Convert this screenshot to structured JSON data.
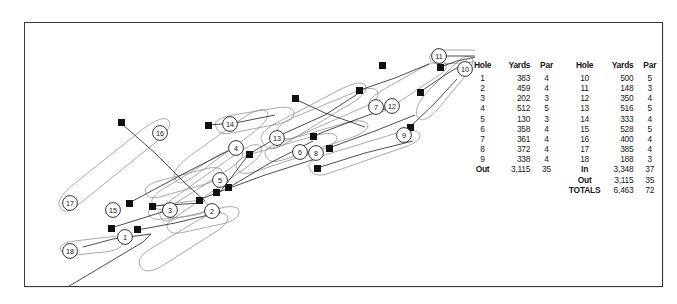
{
  "figure": {
    "kind": "golf-course-routing-plan-with-scorecard",
    "frame_color": "#3a3a3a",
    "ink_color": "#1a1a1a",
    "fairway_color": "#8c8c8c"
  },
  "scorecard": {
    "headers": [
      "Hole",
      "Yards",
      "Par",
      "Hole",
      "Yards",
      "Par"
    ],
    "front_nine": [
      {
        "hole": "1",
        "yards": "383",
        "par": "4"
      },
      {
        "hole": "2",
        "yards": "459",
        "par": "4"
      },
      {
        "hole": "3",
        "yards": "202",
        "par": "3"
      },
      {
        "hole": "4",
        "yards": "512",
        "par": "5"
      },
      {
        "hole": "5",
        "yards": "130",
        "par": "3"
      },
      {
        "hole": "6",
        "yards": "358",
        "par": "4"
      },
      {
        "hole": "7",
        "yards": "361",
        "par": "4"
      },
      {
        "hole": "8",
        "yards": "372",
        "par": "4"
      },
      {
        "hole": "9",
        "yards": "338",
        "par": "4"
      }
    ],
    "back_nine": [
      {
        "hole": "10",
        "yards": "500",
        "par": "5"
      },
      {
        "hole": "11",
        "yards": "148",
        "par": "3"
      },
      {
        "hole": "12",
        "yards": "350",
        "par": "4"
      },
      {
        "hole": "13",
        "yards": "516",
        "par": "5"
      },
      {
        "hole": "14",
        "yards": "333",
        "par": "4"
      },
      {
        "hole": "15",
        "yards": "528",
        "par": "5"
      },
      {
        "hole": "16",
        "yards": "400",
        "par": "4"
      },
      {
        "hole": "17",
        "yards": "385",
        "par": "4"
      },
      {
        "hole": "18",
        "yards": "188",
        "par": "3"
      }
    ],
    "totals": {
      "out_label": "Out",
      "out_yards": "3,115",
      "out_par": "35",
      "in_label": "In",
      "in_yards": "3,348",
      "in_par": "37",
      "out_label_2": "Out",
      "out_yards_2": "3,115",
      "out_par_2": "35",
      "totals_label": "TOTALS",
      "totals_yards": "6,463",
      "totals_par": "72"
    }
  },
  "course_map": {
    "hole_markers": [
      {
        "number": "1",
        "cx": 100,
        "cy": 214
      },
      {
        "number": "2",
        "cx": 187,
        "cy": 188
      },
      {
        "number": "3",
        "cx": 145,
        "cy": 187
      },
      {
        "number": "4",
        "cx": 211,
        "cy": 125
      },
      {
        "number": "5",
        "cx": 195,
        "cy": 157
      },
      {
        "number": "6",
        "cx": 275,
        "cy": 129
      },
      {
        "number": "7",
        "cx": 351,
        "cy": 84
      },
      {
        "number": "8",
        "cx": 291,
        "cy": 130
      },
      {
        "number": "9",
        "cx": 379,
        "cy": 112
      },
      {
        "number": "10",
        "cx": 440,
        "cy": 46
      },
      {
        "number": "11",
        "cx": 414,
        "cy": 33
      },
      {
        "number": "12",
        "cx": 367,
        "cy": 83
      },
      {
        "number": "13",
        "cx": 252,
        "cy": 115
      },
      {
        "number": "14",
        "cx": 205,
        "cy": 101
      },
      {
        "number": "15",
        "cx": 88,
        "cy": 187
      },
      {
        "number": "16",
        "cx": 135,
        "cy": 110
      },
      {
        "number": "17",
        "cx": 45,
        "cy": 180
      },
      {
        "number": "18",
        "cx": 45,
        "cy": 228
      }
    ],
    "tee_markers": [
      {
        "x": 36,
        "y": 268
      },
      {
        "x": 86,
        "y": 205
      },
      {
        "x": 112,
        "y": 207
      },
      {
        "x": 127,
        "y": 183
      },
      {
        "x": 174,
        "y": 177
      },
      {
        "x": 191,
        "y": 170
      },
      {
        "x": 203,
        "y": 165
      },
      {
        "x": 104,
        "y": 180
      },
      {
        "x": 96,
        "y": 100
      },
      {
        "x": 183,
        "y": 102
      },
      {
        "x": 270,
        "y": 76
      },
      {
        "x": 288,
        "y": 113
      },
      {
        "x": 292,
        "y": 145
      },
      {
        "x": 304,
        "y": 125
      },
      {
        "x": 335,
        "y": 67
      },
      {
        "x": 357,
        "y": 42
      },
      {
        "x": 385,
        "y": 104
      },
      {
        "x": 395,
        "y": 69
      },
      {
        "x": 415,
        "y": 44
      },
      {
        "x": 458,
        "y": 33
      },
      {
        "x": 224,
        "y": 131
      }
    ]
  }
}
